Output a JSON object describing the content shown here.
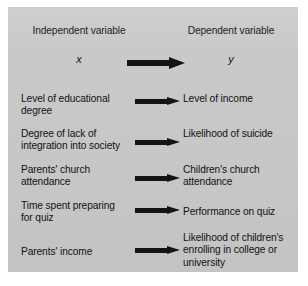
{
  "figure": {
    "background_color": "#c9c9c9",
    "text_color": "#121212",
    "arrow_color": "#141414",
    "headers": {
      "independent": "Independent variable",
      "dependent": "Dependent variable"
    },
    "symbols": {
      "independent": "x",
      "dependent": "y"
    },
    "arrow_icon": "right-arrow-icon",
    "rows": [
      {
        "independent": "Level of educational degree",
        "dependent": "Level of income"
      },
      {
        "independent": "Degree of lack of integration into society",
        "dependent": "Likelihood of suicide"
      },
      {
        "independent": "Parents' church attendance",
        "dependent": "Children's church attendance"
      },
      {
        "independent": "Time spent preparing for quiz",
        "dependent": "Performance on quiz"
      },
      {
        "independent": "Parents' income",
        "dependent": "Likelihood of children's enrolling in college or university"
      }
    ]
  }
}
